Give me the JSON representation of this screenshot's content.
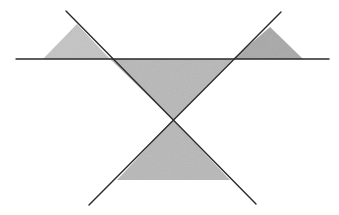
{
  "diagram": {
    "colors": {
      "background": "#ffffff",
      "line": "#2a2a2a",
      "fill_light": "#c4c4c4",
      "fill_mid": "#b8b8b8",
      "fill_dark": "#a8a8a8"
    },
    "lines": [
      {
        "name": "horizontal-line",
        "x1": 16,
        "y1": 59,
        "x2": 329,
        "y2": 59
      },
      {
        "name": "diagonal-line-descending",
        "x1": 66,
        "y1": 11,
        "x2": 256,
        "y2": 204
      },
      {
        "name": "diagonal-line-ascending",
        "x1": 281,
        "y1": 12,
        "x2": 89,
        "y2": 205
      }
    ],
    "triangles": [
      {
        "name": "left-triangle",
        "points": "43,59 77,24 110,59"
      },
      {
        "name": "top-middle-triangle",
        "points": "110,59 233,59 173,120"
      },
      {
        "name": "right-triangle",
        "points": "233,59 270,27 303,59"
      },
      {
        "name": "bottom-triangle",
        "points": "173,120 117,180 230,180"
      }
    ]
  }
}
